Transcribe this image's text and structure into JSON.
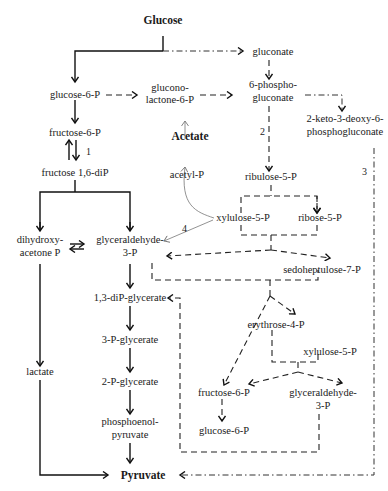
{
  "title": "Glucose",
  "nodes": {
    "glucose": "Glucose",
    "gluconate": "gluconate",
    "glucose6p": "glucose-6-P",
    "gluconolactone_1": "glucono-",
    "gluconolactone_2": "lactone-6-P",
    "phosphogluconate_1": "6-phospho-",
    "phosphogluconate_2": "gluconate",
    "kdpg_1": "2-keto-3-deoxy-6-",
    "kdpg_2": "phosphogluconate",
    "fructose6p": "fructose-6-P",
    "fructose16dip": "fructose 1,6-diP",
    "acetate": "Acetate",
    "acetylp": "acetyl-P",
    "ribulose5p": "ribulose-5-P",
    "xylulose5p": "xylulose-5-P",
    "ribose5p": "ribose-5-P",
    "dhap_1": "dihydroxy-",
    "dhap_2": "acetone P",
    "gap_1": "glyceraldehyde-",
    "gap_2": "3-P",
    "sedoheptulose7p": "sedoheptulose-7-P",
    "diPglycerate": "1,3-diP-glycerate",
    "erythrose4p": "erythrose-4-P",
    "pglycerate3": "3-P-glycerate",
    "xylulose5p_b": "xylulose-5-P",
    "lactate": "lactate",
    "pglycerate2": "2-P-glycerate",
    "fructose6p_b": "fructose-6-P",
    "gap_b_1": "glyceraldehyde-",
    "gap_b_2": "3-P",
    "pep_1": "phosphoenol-",
    "pep_2": "pyruvate",
    "glucose6p_b": "glucose-6-P",
    "pyruvate": "Pyruvate"
  },
  "pathway_numbers": {
    "n1": "1",
    "n2": "2",
    "n3": "3",
    "n4": "4"
  },
  "legend_line_styles": {
    "solid": "glycolysis (EMP pathway)",
    "dashed": "pentose phosphate pathway",
    "dash_dot": "Entner-Doudoroff pathway",
    "thin_gray": "phosphoketolase pathway"
  }
}
